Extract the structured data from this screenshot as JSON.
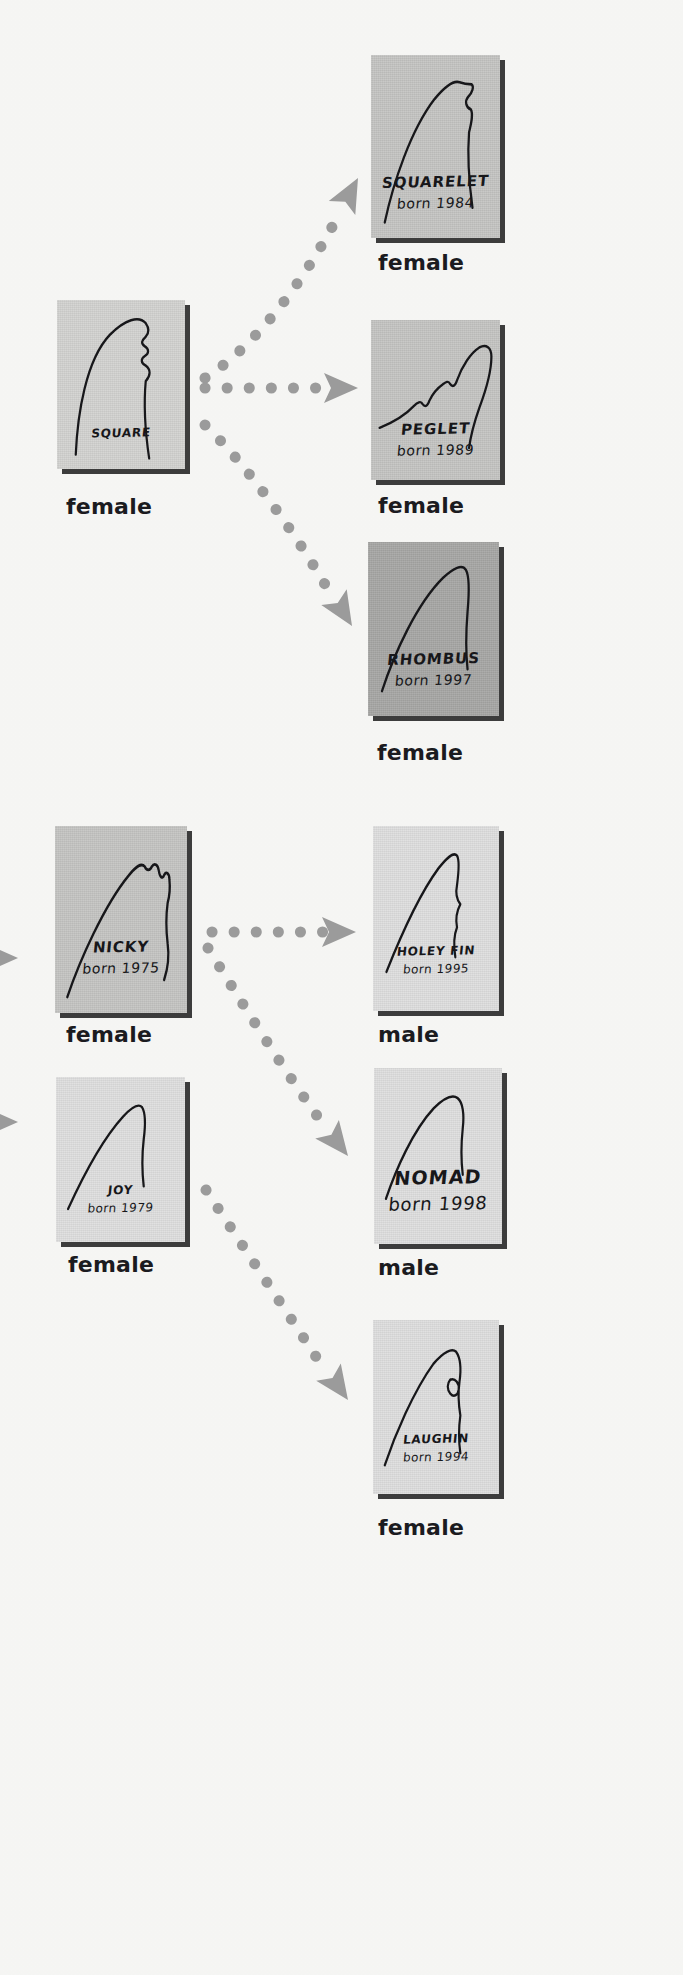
{
  "page": {
    "background_color": "#f8f8f6",
    "arrow_color": "#9b9b9b",
    "ink_color": "#17171a"
  },
  "labels": {
    "female": "female",
    "male": "male",
    "born_prefix": "born"
  },
  "cards": [
    {
      "id": "square",
      "name": "SQUARE",
      "born": "",
      "caption_line2": "",
      "sex": "female",
      "tone": "tone-light",
      "x": 57,
      "y": 300,
      "w": 128,
      "h": 169,
      "caption_top": 126,
      "sex_x": 66,
      "sex_y": 494,
      "size": "small"
    },
    {
      "id": "squarelet",
      "name": "SQUARELET",
      "born": "born 1984",
      "caption_line2": "born 1984",
      "sex": "female",
      "tone": "tone-mid",
      "x": 371,
      "y": 55,
      "w": 129,
      "h": 183,
      "caption_top": 118,
      "sex_x": 378,
      "sex_y": 250,
      "size": "normal"
    },
    {
      "id": "peglet",
      "name": "PEGLET",
      "born": "born 1989",
      "caption_line2": "born 1989",
      "sex": "female",
      "tone": "tone-mid",
      "x": 371,
      "y": 320,
      "w": 129,
      "h": 160,
      "caption_top": 100,
      "sex_x": 378,
      "sex_y": 493,
      "size": "normal"
    },
    {
      "id": "rhombus",
      "name": "RHOMBUS",
      "born": "born 1997",
      "caption_line2": "born 1997",
      "sex": "female",
      "tone": "tone-dark",
      "x": 368,
      "y": 542,
      "w": 131,
      "h": 174,
      "caption_top": 108,
      "sex_x": 377,
      "sex_y": 740,
      "size": "normal"
    },
    {
      "id": "nicky",
      "name": "NICKY",
      "born": "born 1975",
      "caption_line2": "born 1975",
      "sex": "female",
      "tone": "tone-mid",
      "x": 55,
      "y": 826,
      "w": 132,
      "h": 187,
      "caption_top": 112,
      "sex_x": 66,
      "sex_y": 1022,
      "size": "normal"
    },
    {
      "id": "holeyfin",
      "name": "HOLEY FIN",
      "born": "born 1995",
      "caption_line2": "born 1995",
      "sex": "male",
      "tone": "tone-pale",
      "x": 373,
      "y": 826,
      "w": 126,
      "h": 185,
      "caption_top": 118,
      "sex_x": 378,
      "sex_y": 1022,
      "size": "small"
    },
    {
      "id": "joy",
      "name": "JOY",
      "born": "born 1979",
      "caption_line2": "born 1979",
      "sex": "female",
      "tone": "tone-pale",
      "x": 56,
      "y": 1077,
      "w": 129,
      "h": 165,
      "caption_top": 106,
      "sex_x": 68,
      "sex_y": 1252,
      "size": "small"
    },
    {
      "id": "nomad",
      "name": "NOMAD",
      "born": "born 1998",
      "caption_line2": "born 1998",
      "sex": "male",
      "tone": "tone-pale",
      "x": 374,
      "y": 1068,
      "w": 128,
      "h": 176,
      "caption_top": 98,
      "sex_x": 378,
      "sex_y": 1255,
      "size": "big"
    },
    {
      "id": "laughin",
      "name": "LAUGHIN",
      "born": "born 1994",
      "caption_line2": "born 1994",
      "sex": "female",
      "tone": "tone-pale",
      "x": 373,
      "y": 1320,
      "w": 126,
      "h": 174,
      "caption_top": 112,
      "sex_x": 378,
      "sex_y": 1515,
      "size": "small"
    }
  ],
  "fins": {
    "square": "M 22 160 C 24 118, 34 62, 62 36 C 80 20, 96 16, 104 24 C 108 29, 108 34, 104 38 C 99 42, 98 45, 103 48 C 108 51, 108 55, 103 58 C 98 61, 98 65, 104 68 C 110 72, 110 78, 104 84 C 101 112, 104 140, 108 164",
    "squarelet": "M 16 160 C 26 122, 46 72, 74 42 C 86 30, 96 24, 103 26 C 106 27, 112 28, 117 28 C 120 30, 118 36, 113 40 C 109 44, 110 50, 116 52 C 119 56, 117 64, 114 74 C 112 96, 114 122, 118 146",
    "peglet": "M 10 118 C 26 112, 40 104, 50 94 C 54 90, 58 88, 60 92 C 63 96, 66 94, 68 88 C 72 80, 78 74, 84 70 C 87 68, 90 66, 92 70 C 95 74, 98 72, 100 66 C 106 50, 116 36, 126 30 C 134 26, 140 30, 140 40 C 140 56, 134 76, 126 96 C 120 112, 116 126, 114 140",
    "rhombus": "M 16 150 C 30 112, 56 62, 86 36 C 98 26, 108 22, 112 28 C 116 34, 116 50, 114 70 C 112 92, 112 112, 114 128",
    "nicky": "M 14 160 C 28 126, 56 74, 84 46 C 92 38, 98 34, 102 38 C 104 42, 108 42, 110 38 C 113 34, 117 36, 118 42 C 119 48, 122 50, 124 46 C 126 42, 130 44, 130 50 C 131 58, 130 66, 128 72 C 126 84, 126 96, 128 110 C 130 122, 128 134, 124 144",
    "holeyfin": "M 16 138 C 30 110, 54 66, 78 40 C 88 30, 96 24, 100 28 C 103 32, 102 44, 100 56 C 98 64, 100 70, 104 74 C 100 80, 98 88, 100 96 C 96 104, 96 114, 98 124",
    "joy": "M 14 140 C 28 112, 52 68, 78 42 C 88 32, 96 28, 100 32 C 104 38, 104 52, 102 66 C 100 82, 100 100, 102 116",
    "nomad": "M 14 130 C 26 100, 46 62, 70 40 C 82 30, 92 26, 98 30 C 104 34, 106 46, 104 60 C 102 76, 102 92, 104 106",
    "laughin": "M 14 146 C 26 116, 48 72, 72 44 C 84 32, 94 28, 99 32 C 104 38, 105 50, 103 62 C 101 74, 102 86, 104 96 C 102 108, 102 122, 104 134 M 92 60 C 88 64, 88 70, 92 74 C 96 78, 101 76, 102 70 C 103 64, 98 58, 92 60"
  },
  "arrows": [
    {
      "id": "square-to-squarelet",
      "from": "SQUARE",
      "to": "SQUARELET",
      "path": "M 205 378 C 250 350, 300 290, 340 212",
      "head_x": 358,
      "head_y": 178,
      "head_rot": -62
    },
    {
      "id": "square-to-peglet",
      "from": "SQUARE",
      "to": "PEGLET",
      "path": "M 205 388 L 334 388",
      "head_x": 358,
      "head_y": 388,
      "head_rot": 0
    },
    {
      "id": "square-to-rhombus",
      "from": "SQUARE",
      "to": "RHOMBUS",
      "path": "M 205 425 C 250 468, 300 540, 334 600",
      "head_x": 352,
      "head_y": 626,
      "head_rot": 58
    },
    {
      "id": "into-nicky",
      "from": "",
      "to": "NICKY",
      "path": "M -10 958 L 10 958",
      "head_x": 18,
      "head_y": 958,
      "head_rot": 0
    },
    {
      "id": "into-joy",
      "from": "",
      "to": "JOY",
      "path": "M -10 1122 L 10 1122",
      "head_x": 18,
      "head_y": 1122,
      "head_rot": 0
    },
    {
      "id": "nicky-to-holeyfin",
      "from": "NICKY",
      "to": "HOLEY FIN",
      "path": "M 212 932 L 330 932",
      "head_x": 356,
      "head_y": 932,
      "head_rot": 0
    },
    {
      "id": "nicky-to-nomad",
      "from": "NICKY",
      "to": "NOMAD",
      "path": "M 208 948 C 240 1000, 290 1080, 326 1128",
      "head_x": 348,
      "head_y": 1156,
      "head_rot": 52
    },
    {
      "id": "joy-to-laughin",
      "from": "JOY",
      "to": "LAUGHIN",
      "path": "M 206 1190 C 244 1248, 292 1320, 326 1372",
      "head_x": 348,
      "head_y": 1400,
      "head_rot": 55
    }
  ]
}
